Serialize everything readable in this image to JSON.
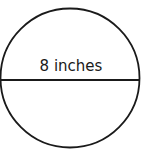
{
  "diagram": {
    "shape": "circle",
    "diameter_label": "8 inches",
    "stroke_color": "#1a1a1a",
    "background": "#ffffff"
  }
}
